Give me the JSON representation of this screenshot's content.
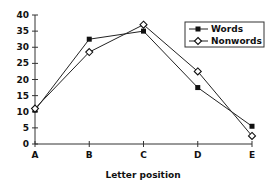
{
  "chart_data": {
    "type": "line",
    "title": "",
    "xlabel": "Letter position",
    "ylabel": "",
    "categories": [
      "A",
      "B",
      "C",
      "D",
      "E"
    ],
    "series": [
      {
        "name": "Words",
        "marker": "filled-square",
        "values": [
          10.5,
          32.5,
          35,
          17.5,
          5.5
        ]
      },
      {
        "name": "Nonwords",
        "marker": "open-diamond",
        "values": [
          11,
          28.5,
          37,
          22.5,
          2.5
        ]
      }
    ],
    "ylim": [
      0,
      40
    ],
    "yticks": [
      0,
      5,
      10,
      15,
      20,
      25,
      30,
      35,
      40
    ],
    "grid": false,
    "legend_position": "top-right"
  }
}
